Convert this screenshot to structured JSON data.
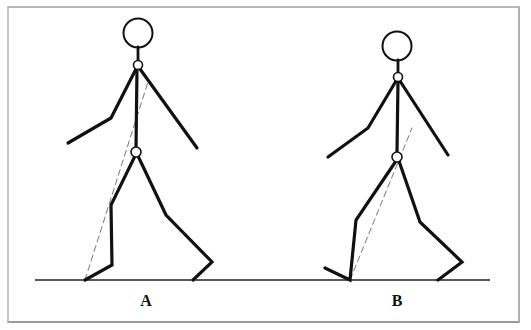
{
  "diagram": {
    "colors": {
      "stroke": "#111111",
      "dashed_line": "#777777",
      "ground": "#222222",
      "frame": "#b0b0b0",
      "background": "#ffffff"
    },
    "figures": [
      {
        "id": "A",
        "label": "A",
        "label_x": 146
      },
      {
        "id": "B",
        "label": "B",
        "label_x": 397
      }
    ]
  }
}
